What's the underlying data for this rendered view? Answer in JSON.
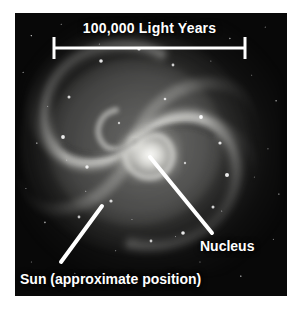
{
  "figure": {
    "plate_background": "#080808",
    "annotation_color": "#ffffff"
  },
  "scale_bar": {
    "label": "100,000 Light Years",
    "value": 100000,
    "unit": "Light Years",
    "left_tick_x": 54,
    "right_tick_x": 245,
    "bar_y": 48,
    "tick_top_y": 37,
    "tick_bottom_y": 59
  },
  "callouts": [
    {
      "id": "nucleus",
      "label": "Nucleus",
      "pointer_start_x": 150,
      "pointer_start_y": 157,
      "pointer_end_x": 212,
      "pointer_end_y": 233,
      "label_x": 200,
      "label_y": 238
    },
    {
      "id": "sun",
      "label": "Sun (approximate position)",
      "pointer_start_x": 102,
      "pointer_start_y": 206,
      "pointer_end_x": 61,
      "pointer_end_y": 262,
      "label_x": 20,
      "label_y": 271
    }
  ],
  "galaxy": {
    "center_x": 135,
    "center_y": 142,
    "type": "spiral",
    "arm_count": 4,
    "rotation_sense": "counterclockwise"
  }
}
